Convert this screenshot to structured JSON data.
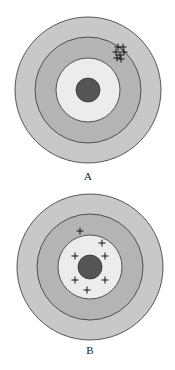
{
  "colors": {
    "outer_ring": "#c8c8c8",
    "middle_ring": "#b4b4b4",
    "inner_ring": "#ececec",
    "bullseye": "#555555",
    "stroke": "#333333",
    "mark": "#111111"
  },
  "targets": [
    {
      "label": "A",
      "center": [
        88,
        90
      ],
      "radii": [
        73,
        53,
        32,
        12
      ],
      "marks": [
        [
          118,
          47
        ],
        [
          123,
          47
        ],
        [
          116,
          52
        ],
        [
          124,
          52
        ],
        [
          120,
          55
        ],
        [
          117,
          58
        ],
        [
          121,
          59
        ]
      ]
    },
    {
      "label": "B",
      "center": [
        90,
        267
      ],
      "radii": [
        73,
        53,
        32,
        12
      ],
      "marks": [
        [
          80,
          231
        ],
        [
          102,
          243
        ],
        [
          75,
          256
        ],
        [
          105,
          256
        ],
        [
          75,
          280
        ],
        [
          105,
          280
        ],
        [
          87,
          290
        ]
      ]
    }
  ]
}
